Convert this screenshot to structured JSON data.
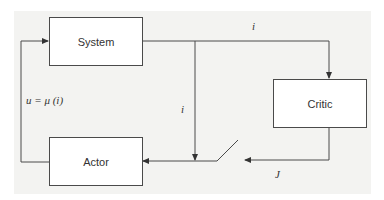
{
  "diagram": {
    "type": "block-diagram",
    "blocks": [
      {
        "id": "system",
        "label": "System"
      },
      {
        "id": "critic",
        "label": "Critic"
      },
      {
        "id": "actor",
        "label": "Actor"
      }
    ],
    "signals": {
      "state_top": "i",
      "state_middle": "i",
      "critic_output": "J",
      "control": "u = μ (i)"
    },
    "edges": [
      {
        "from": "system",
        "to": "critic",
        "label": "i"
      },
      {
        "from": "system",
        "to": "actor",
        "label": "i"
      },
      {
        "from": "critic",
        "to": "actor",
        "label": "J",
        "via": "switch"
      },
      {
        "from": "actor",
        "to": "system",
        "label": "u = μ (i)"
      }
    ],
    "colors": {
      "line": "#4a4a4a",
      "panel": "#f3f3f1",
      "box": "#ffffff"
    }
  }
}
